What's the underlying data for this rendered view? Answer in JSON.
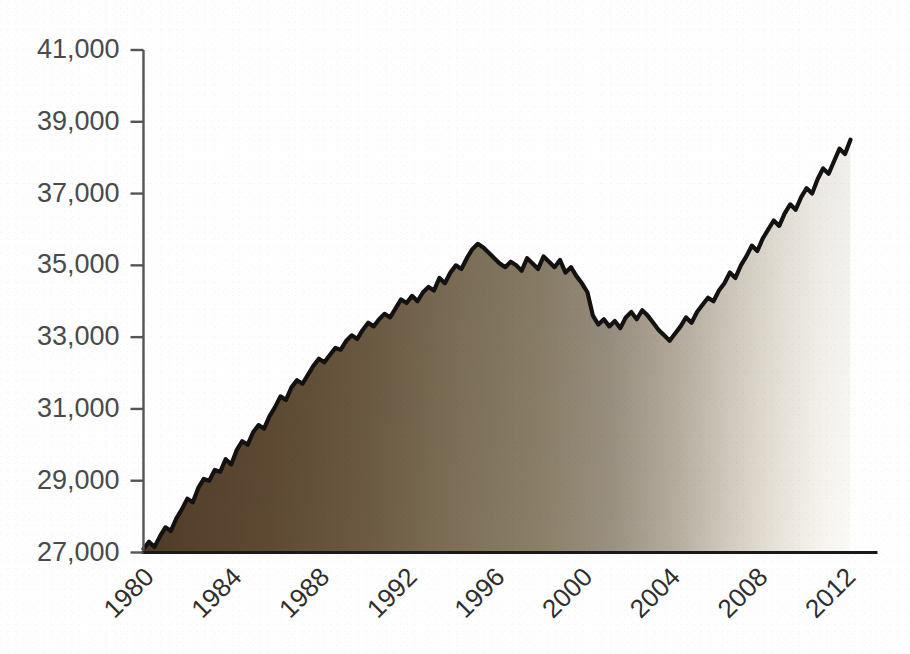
{
  "chart_data": {
    "type": "area",
    "title": "",
    "subtitle": "",
    "xlabel": "",
    "ylabel": "",
    "xlim": [
      1980,
      2012.5
    ],
    "ylim": [
      27000,
      41000
    ],
    "grid": false,
    "legend": null,
    "annotations": [],
    "style": {
      "fill_gradient_start": "#5a4530",
      "fill_gradient_mid": "#8e8069",
      "fill_gradient_end": "#faf8f4",
      "line_color": "#141210",
      "axis_color": "#1a1a1a",
      "tick_label_color": "#4a4a4a",
      "background": "#fefefe"
    },
    "ytick_labels": [
      "41,000",
      "39,000",
      "37,000",
      "35,000",
      "33,000",
      "31,000",
      "29,000",
      "27,000"
    ],
    "ytick_values": [
      41000,
      39000,
      37000,
      35000,
      33000,
      31000,
      29000,
      27000
    ],
    "xtick_labels": [
      "1980",
      "1984",
      "1988",
      "1992",
      "1996",
      "2000",
      "2004",
      "2008",
      "2012"
    ],
    "xtick_values": [
      1980,
      1984,
      1988,
      1992,
      1996,
      2000,
      2004,
      2008,
      2012
    ],
    "series": [
      {
        "name": "series-1",
        "x": [
          1980.0,
          1980.25,
          1980.5,
          1980.75,
          1981.0,
          1981.25,
          1981.5,
          1981.75,
          1982.0,
          1982.25,
          1982.5,
          1982.75,
          1983.0,
          1983.25,
          1983.5,
          1983.75,
          1984.0,
          1984.25,
          1984.5,
          1984.75,
          1985.0,
          1985.25,
          1985.5,
          1985.75,
          1986.0,
          1986.25,
          1986.5,
          1986.75,
          1987.0,
          1987.25,
          1987.5,
          1987.75,
          1988.0,
          1988.25,
          1988.5,
          1988.75,
          1989.0,
          1989.25,
          1989.5,
          1989.75,
          1990.0,
          1990.25,
          1990.5,
          1990.75,
          1991.0,
          1991.25,
          1991.5,
          1991.75,
          1992.0,
          1992.25,
          1992.5,
          1992.75,
          1993.0,
          1993.25,
          1993.5,
          1993.75,
          1994.0,
          1994.25,
          1994.5,
          1994.75,
          1995.0,
          1995.25,
          1995.5,
          1995.75,
          1996.0,
          1996.25,
          1996.5,
          1996.75,
          1997.0,
          1997.25,
          1997.5,
          1997.75,
          1998.0,
          1998.25,
          1998.5,
          1998.75,
          1999.0,
          1999.25,
          1999.5,
          1999.75,
          2000.0,
          2000.25,
          2000.5,
          2000.75,
          2001.0,
          2001.25,
          2001.5,
          2001.75,
          2002.0,
          2002.25,
          2002.5,
          2002.75,
          2003.0,
          2003.25,
          2003.5,
          2003.75,
          2004.0,
          2004.25,
          2004.5,
          2004.75,
          2005.0,
          2005.25,
          2005.5,
          2005.75,
          2006.0,
          2006.25,
          2006.5,
          2006.75,
          2007.0,
          2007.25,
          2007.5,
          2007.75,
          2008.0,
          2008.25,
          2008.5,
          2008.75,
          2009.0,
          2009.25,
          2009.5,
          2009.75,
          2010.0,
          2010.25,
          2010.5,
          2010.75,
          2011.0,
          2011.25,
          2011.5,
          2011.75,
          2012.0,
          2012.25
        ],
        "values": [
          27100,
          27300,
          27150,
          27450,
          27700,
          27600,
          27950,
          28200,
          28500,
          28400,
          28800,
          29050,
          29000,
          29300,
          29250,
          29600,
          29450,
          29850,
          30100,
          30000,
          30350,
          30550,
          30450,
          30800,
          31050,
          31350,
          31250,
          31600,
          31800,
          31700,
          31950,
          32200,
          32400,
          32300,
          32500,
          32700,
          32650,
          32900,
          33050,
          32950,
          33200,
          33400,
          33300,
          33500,
          33650,
          33550,
          33800,
          34050,
          33950,
          34150,
          34000,
          34250,
          34400,
          34300,
          34650,
          34500,
          34800,
          35000,
          34900,
          35200,
          35450,
          35600,
          35500,
          35350,
          35200,
          35050,
          34950,
          35100,
          35000,
          34850,
          35200,
          35050,
          34900,
          35250,
          35100,
          34950,
          35150,
          34800,
          34950,
          34700,
          34500,
          34250,
          33600,
          33350,
          33500,
          33300,
          33450,
          33250,
          33550,
          33700,
          33500,
          33750,
          33600,
          33400,
          33200,
          33050,
          32900,
          33100,
          33300,
          33550,
          33400,
          33700,
          33900,
          34100,
          34000,
          34300,
          34500,
          34800,
          34650,
          35000,
          35250,
          35550,
          35400,
          35750,
          36000,
          36250,
          36100,
          36450,
          36700,
          36550,
          36900,
          37150,
          37000,
          37400,
          37700,
          37550,
          37900,
          38250,
          38100,
          38500
        ]
      }
    ],
    "notes": {
      "start_value": 27100,
      "peak_value": 35600,
      "peak_year": 1995.25,
      "trough_value": 32900,
      "trough_year": 2004.0,
      "end_value": 39400,
      "end_year": 2012.3
    }
  },
  "axes": {
    "y_axis_name": "value-axis",
    "x_axis_name": "year-axis",
    "x_rotation_degrees": -45
  }
}
